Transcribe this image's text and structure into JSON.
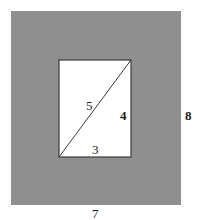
{
  "figure": {
    "colors": {
      "background": "#ffffff",
      "outer_fill": "#8f8f8f",
      "inner_fill": "#ffffff",
      "line": "#3a3a3a",
      "text": "#1a1a1a"
    },
    "outer_rectangle": {
      "width_label": "7",
      "height_label": "8"
    },
    "inner_rectangle": {
      "width_label": "3",
      "height_label": "4",
      "diagonal_label": "5"
    }
  }
}
